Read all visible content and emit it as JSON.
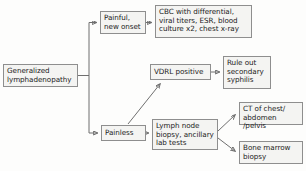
{
  "diagram": {
    "colors": {
      "box_border": "#8e8e8e",
      "box_fill": "#f4f4f2",
      "connector": "#6f6f6f",
      "text": "#1a1a1a",
      "background": "#fdfdfc"
    },
    "nodes": [
      {
        "id": "root",
        "label": "Generalized\nlymphadenopathy",
        "x": 3,
        "y": 64,
        "w": 75,
        "h": 23
      },
      {
        "id": "painful",
        "label": "Painful,\nnew onset",
        "x": 100,
        "y": 11,
        "w": 46,
        "h": 23
      },
      {
        "id": "workup",
        "label": "CBC with differential,\nviral titers, ESR, blood\nculture x2, chest x-ray",
        "x": 155,
        "y": 5,
        "w": 97,
        "h": 33
      },
      {
        "id": "vdrl",
        "label": "VDRL positive",
        "x": 150,
        "y": 64,
        "w": 61,
        "h": 16
      },
      {
        "id": "syphilis",
        "label": "Rule out\nsecondary\nsyphilis",
        "x": 223,
        "y": 56,
        "w": 48,
        "h": 33
      },
      {
        "id": "painless",
        "label": "Painless",
        "x": 101,
        "y": 125,
        "w": 45,
        "h": 16
      },
      {
        "id": "biopsy",
        "label": "Lymph node\nbiopsy, ancillary\nlab tests",
        "x": 152,
        "y": 119,
        "w": 66,
        "h": 31
      },
      {
        "id": "ct",
        "label": "CT of chest/\nabdomen /pelvis",
        "x": 239,
        "y": 102,
        "w": 64,
        "h": 23
      },
      {
        "id": "marrow",
        "label": "Bone marrow\nbiopsy",
        "x": 239,
        "y": 141,
        "w": 64,
        "h": 23
      }
    ],
    "edges": [
      {
        "from": "root",
        "to": "painful",
        "style": "elbow"
      },
      {
        "from": "root",
        "to": "painless",
        "style": "elbow"
      },
      {
        "from": "painful",
        "to": "workup",
        "style": "straight"
      },
      {
        "from": "vdrl",
        "to": "syphilis",
        "style": "straight"
      },
      {
        "from": "painless",
        "to": "vdrl",
        "style": "diagonal"
      },
      {
        "from": "painless",
        "to": "biopsy",
        "style": "straight"
      },
      {
        "from": "biopsy",
        "to": "ct",
        "style": "diagonal"
      },
      {
        "from": "biopsy",
        "to": "marrow",
        "style": "diagonal"
      }
    ]
  }
}
